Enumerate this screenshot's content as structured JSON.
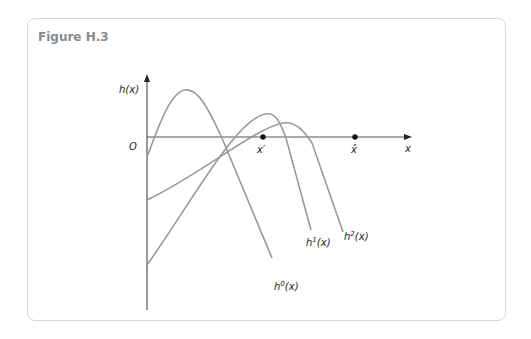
{
  "figure": {
    "title": "Figure H.3",
    "axes": {
      "y_label": "h(x)",
      "x_label": "x",
      "origin_label": "O"
    },
    "points": [
      {
        "name": "x-prime",
        "label": "x′"
      },
      {
        "name": "x-hat",
        "label": "x̂"
      }
    ],
    "curves": [
      {
        "name": "h0",
        "label_base": "h",
        "label_sup": "0",
        "label_tail": "(x)"
      },
      {
        "name": "h1",
        "label_base": "h",
        "label_sup": "1",
        "label_tail": "(x)"
      },
      {
        "name": "h2",
        "label_base": "h",
        "label_sup": "2",
        "label_tail": "(x)"
      }
    ],
    "colors": {
      "curve": "#9a9a9a",
      "axis": "#555555",
      "point": "#111111",
      "frame": "#d6d6d6",
      "title": "#8a8a8a"
    }
  }
}
